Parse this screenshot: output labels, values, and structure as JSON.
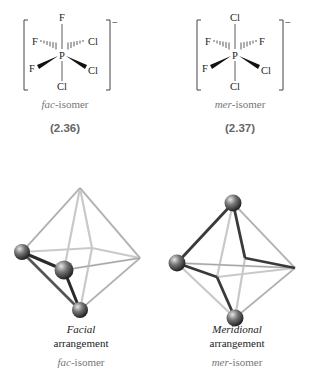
{
  "figure": {
    "left": {
      "structure": {
        "central_atom": "P",
        "top": "F",
        "bottom": "Cl",
        "back_left": "F",
        "back_right": "Cl",
        "front_left": "F",
        "front_right": "Cl",
        "charge": "−"
      },
      "isomer_prefix": "fac",
      "isomer_suffix": "-isomer",
      "equation_number": "(2.36)",
      "model": {
        "arrangement_title": "Facial",
        "arrangement_sub": "arrangement",
        "isomer_prefix": "fac",
        "isomer_suffix": "-isomer"
      }
    },
    "right": {
      "structure": {
        "central_atom": "P",
        "top": "Cl",
        "bottom": "Cl",
        "back_left": "F",
        "back_right": "F",
        "front_left": "F",
        "front_right": "Cl",
        "charge": "−"
      },
      "isomer_prefix": "mer",
      "isomer_suffix": "-isomer",
      "equation_number": "(2.37)",
      "model": {
        "arrangement_title": "Meridional",
        "arrangement_sub": "arrangement",
        "isomer_prefix": "mer",
        "isomer_suffix": "-isomer"
      }
    }
  }
}
